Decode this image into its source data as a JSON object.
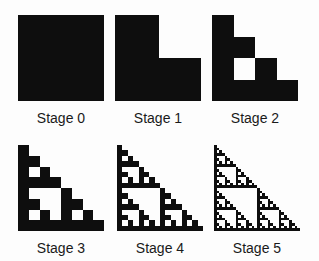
{
  "diagram": {
    "fill_color": "#0e0e0e",
    "background_color": "#fdfdfd",
    "stages": [
      {
        "label": "Stage 0",
        "n": 0
      },
      {
        "label": "Stage 1",
        "n": 1
      },
      {
        "label": "Stage 2",
        "n": 2
      },
      {
        "label": "Stage 3",
        "n": 3
      },
      {
        "label": "Stage 4",
        "n": 4
      },
      {
        "label": "Stage 5",
        "n": 5
      }
    ]
  }
}
